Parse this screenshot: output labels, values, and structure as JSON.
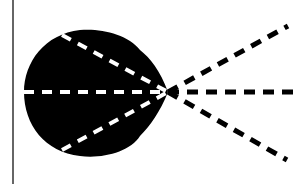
{
  "diagram": {
    "type": "radiation-pattern",
    "colors": {
      "background": "#ffffff",
      "fill": "#000000",
      "dash_inside": "#ffffff",
      "dash_outside": "#000000",
      "border": "#333333"
    },
    "border_left_x": 13,
    "origin": {
      "x": 168,
      "y": 92
    },
    "lobe": {
      "path": "M168,92 C160,70 150,58 140,50 C128,34 100,28 80,30 C45,34 24,62 24,92 C24,125 45,152 80,156 C102,159 130,152 140,136 C150,126 160,112 168,92 Z"
    },
    "rays": [
      {
        "name": "ray-upper",
        "inner": [
          62,
          35
        ],
        "outer": [
          288,
          26
        ]
      },
      {
        "name": "ray-center",
        "inner": [
          24,
          92
        ],
        "outer": [
          299,
          92
        ]
      },
      {
        "name": "ray-lower",
        "inner": [
          62,
          150
        ],
        "outer": [
          287,
          160
        ]
      }
    ]
  }
}
